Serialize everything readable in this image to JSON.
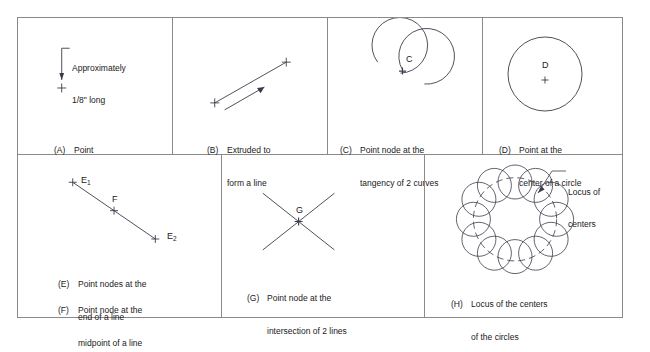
{
  "figure": {
    "title_hidden": "",
    "stroke_color": "#3b3b49",
    "border_color": "#8a8a8a",
    "panels": [
      {
        "id": "A",
        "tag": "(A)",
        "caption_lines": [
          "Point"
        ],
        "annotation_lines": [
          "Approximately",
          "1/8\" long"
        ],
        "node_labels": []
      },
      {
        "id": "B",
        "tag": "(B)",
        "caption_lines": [
          "Extruded to",
          "form a line"
        ],
        "annotation_lines": [],
        "node_labels": []
      },
      {
        "id": "C",
        "tag": "(C)",
        "caption_lines": [
          "Point node at the",
          "tangency of 2 curves"
        ],
        "annotation_lines": [],
        "node_labels": [
          "C"
        ]
      },
      {
        "id": "D",
        "tag": "(D)",
        "caption_lines": [
          "Point at the",
          "center of a circle"
        ],
        "annotation_lines": [],
        "node_labels": [
          "D"
        ]
      },
      {
        "id": "EF",
        "tag": "(E)",
        "caption_lines": [
          "Point nodes at the",
          "end of a line"
        ],
        "tag2": "(F)",
        "caption_lines2": [
          "Point node at the",
          "midpoint of a line"
        ],
        "annotation_lines": [],
        "node_labels": [
          "E1",
          "F",
          "E2"
        ]
      },
      {
        "id": "G",
        "tag": "(G)",
        "caption_lines": [
          "Point node at the",
          "intersection of 2 lines"
        ],
        "annotation_lines": [],
        "node_labels": [
          "G"
        ]
      },
      {
        "id": "H",
        "tag": "(H)",
        "caption_lines": [
          "Locus of the centers",
          "of the circles"
        ],
        "annotation_lines": [
          "Locus of",
          "centers"
        ],
        "node_labels": []
      }
    ],
    "labels": {
      "a_note_1": "Approximately",
      "a_note_2": "1/8\" long",
      "a_tag": "(A)",
      "a_cap_1": "Point",
      "b_tag": "(B)",
      "b_cap_1": "Extruded to",
      "b_cap_2": "form a line",
      "c_tag": "(C)",
      "c_cap_1": "Point node at the",
      "c_cap_2": "tangency of 2 curves",
      "c_node": "C",
      "d_tag": "(D)",
      "d_cap_1": "Point at the",
      "d_cap_2": "center of a circle",
      "d_node": "D",
      "e_tag": "(E)",
      "e_cap_1": "Point nodes at the",
      "e_cap_2": "end of a line",
      "f_tag": "(F)",
      "f_cap_1": "Point node at the",
      "f_cap_2": "midpoint of a line",
      "e1_node": "E",
      "e1_sub": "1",
      "e2_node": "E",
      "e2_sub": "2",
      "f_node": "F",
      "g_tag": "(G)",
      "g_cap_1": "Point node at the",
      "g_cap_2": "intersection of 2 lines",
      "g_node": "G",
      "h_tag": "(H)",
      "h_cap_1": "Locus of the centers",
      "h_cap_2": "of the circles",
      "h_note_1": "Locus of",
      "h_note_2": "centers"
    }
  }
}
